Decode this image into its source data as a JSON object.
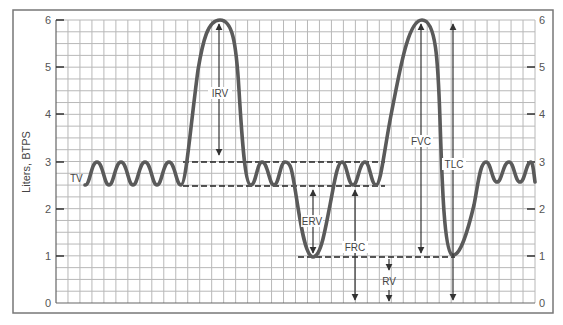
{
  "chart_data": {
    "type": "line",
    "title": "",
    "xlabel": "",
    "ylabel": "Liters, BTPS",
    "ylim": [
      0,
      6
    ],
    "yticks": [
      0,
      1,
      2,
      3,
      4,
      5,
      6
    ],
    "yticks_right": [
      0,
      1,
      2,
      3,
      4,
      5,
      6
    ],
    "grid": true,
    "legend": null,
    "series": [
      {
        "name": "Spirogram volume trace",
        "description": "Tidal breathing oscillating between 2.5 and 3 L, max inspiration to 6 L, tidal breathing, max expiration to 1 L, tidal breathing, max inspiration to 6 L followed by max expiration to ~1 L, then tidal breathing",
        "values_liters_key_points": [
          2.5,
          3,
          2.5,
          3,
          2.5,
          3,
          2.5,
          3,
          2.5,
          6,
          2.5,
          3,
          2.5,
          3,
          2.5,
          1,
          3,
          2.5,
          3,
          2.5,
          6,
          1.05,
          3,
          2.6,
          3,
          2.6,
          3,
          2.6
        ]
      }
    ],
    "reference_levels": {
      "end_inspiratory_level": 3,
      "end_expiratory_level": 2.5,
      "residual_volume_level": 1,
      "total_lung_capacity_level": 6
    },
    "annotations": [
      {
        "label": "TV",
        "meaning": "Tidal volume",
        "from": 2.5,
        "to": 3
      },
      {
        "label": "IRV",
        "meaning": "Inspiratory reserve volume",
        "from": 3,
        "to": 6
      },
      {
        "label": "ERV",
        "meaning": "Expiratory reserve volume",
        "from": 2.5,
        "to": 1
      },
      {
        "label": "FRC",
        "meaning": "Functional residual capacity",
        "from": 0,
        "to": 2.5
      },
      {
        "label": "RV",
        "meaning": "Residual volume",
        "from": 0,
        "to": 1
      },
      {
        "label": "FVC",
        "meaning": "Forced vital capacity",
        "from": 1,
        "to": 6
      },
      {
        "label": "TLC",
        "meaning": "Total lung capacity",
        "from": 0,
        "to": 6
      }
    ]
  },
  "axis": {
    "ylabel": "Liters, BTPS",
    "left_ticks": [
      "0",
      "1",
      "2",
      "3",
      "4",
      "5",
      "6"
    ],
    "right_ticks": [
      "0",
      "1",
      "2",
      "3",
      "4",
      "5",
      "6"
    ]
  },
  "labels": {
    "tv": "TV",
    "irv": "IRV",
    "erv": "ERV",
    "frc": "FRC",
    "rv": "RV",
    "fvc": "FVC",
    "tlc": "TLC"
  },
  "colors": {
    "trace": "#5a5a5a",
    "grid": "#b5b5b5",
    "frame": "#777777",
    "annotation": "#333333"
  }
}
